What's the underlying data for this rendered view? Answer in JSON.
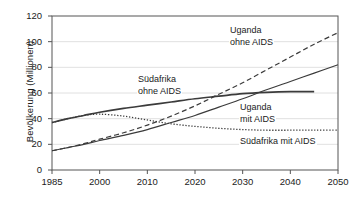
{
  "chart_data": {
    "type": "line",
    "title": "",
    "xlabel": "",
    "ylabel": "Bevölkerung (Millionen)",
    "xlim": [
      1985,
      2050
    ],
    "ylim": [
      0,
      120
    ],
    "grid": "horizontal",
    "legend_position": "inline-annotations",
    "x_ticks": [
      "1985",
      "2000",
      "2010",
      "2020",
      "2030",
      "2040",
      "2050"
    ],
    "x_tick_values": [
      1985,
      2000,
      2010,
      2020,
      2030,
      2040,
      2050
    ],
    "y_ticks": [
      "0",
      "20",
      "40",
      "60",
      "80",
      "100",
      "120"
    ],
    "y_tick_values": [
      0,
      20,
      40,
      60,
      80,
      100,
      120
    ],
    "series": [
      {
        "name": "Südafrika ohne AIDS",
        "style": "solid",
        "label": "Südafrika\nohne AIDS",
        "label_line1": "Südafrika",
        "label_line2": "ohne AIDS",
        "x": [
          1985,
          1990,
          1995,
          2000,
          2005,
          2010,
          2015,
          2020,
          2025,
          2030,
          2035,
          2040,
          2045
        ],
        "values": [
          37,
          40,
          42.5,
          45,
          48,
          50.5,
          53,
          55.5,
          57.5,
          59.5,
          60.5,
          61,
          61
        ]
      },
      {
        "name": "Südafrika mit AIDS",
        "style": "dotted",
        "label": "Südafrika mit AIDS",
        "label_line1": "Südafrika mit AIDS",
        "label_line2": "",
        "x": [
          1985,
          1990,
          1995,
          2000,
          2005,
          2010,
          2015,
          2020,
          2025,
          2030,
          2035,
          2040,
          2045,
          2050
        ],
        "values": [
          37,
          40,
          42.5,
          43.5,
          42,
          39,
          36,
          34,
          32.5,
          31.5,
          31,
          31,
          31,
          31
        ]
      },
      {
        "name": "Uganda ohne AIDS",
        "style": "dashed",
        "label": "Uganda\nohne AIDS",
        "label_line1": "Uganda",
        "label_line2": "ohne AIDS",
        "x": [
          1985,
          1990,
          1995,
          2000,
          2005,
          2010,
          2015,
          2020,
          2025,
          2030,
          2035,
          2040,
          2045,
          2050
        ],
        "values": [
          15,
          17.5,
          20.5,
          24,
          29,
          35,
          42,
          50,
          59,
          68,
          78,
          88,
          98,
          107
        ]
      },
      {
        "name": "Uganda mit AIDS",
        "style": "solid-thin",
        "label": "Uganda\nmit AIDS",
        "label_line1": "Uganda",
        "label_line2": "mit AIDS",
        "x": [
          1985,
          1990,
          1995,
          2000,
          2005,
          2010,
          2015,
          2020,
          2025,
          2030,
          2035,
          2040,
          2045,
          2050
        ],
        "values": [
          15,
          17.5,
          20,
          23,
          27,
          31.5,
          37,
          42.5,
          49,
          55.5,
          62.5,
          69,
          75.5,
          82
        ]
      }
    ],
    "colors": {
      "line": "#3b3b3b",
      "grid": "#d8d8d8",
      "axis": "#555555",
      "text": "#1b1b1b",
      "background": "#ffffff"
    }
  }
}
